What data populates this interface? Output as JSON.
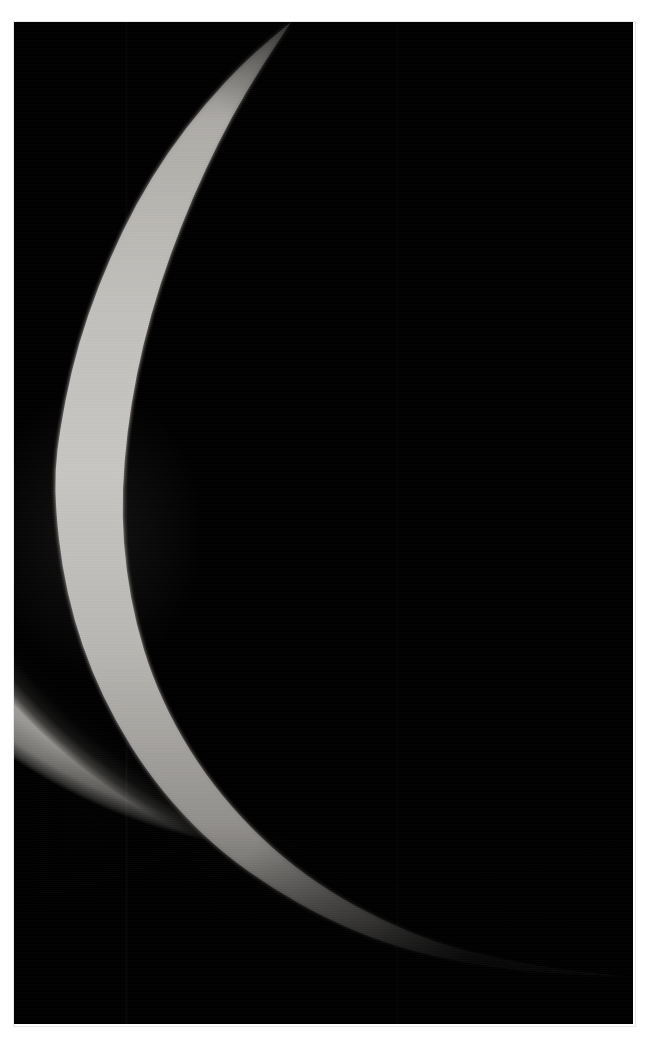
{
  "page": {
    "width": 646,
    "height": 1062,
    "background_color": "#ffffff",
    "caption": ""
  },
  "plate": {
    "name": "astronomical-photograph",
    "left": 14,
    "top": 22,
    "width": 619,
    "height": 1002,
    "sky_color": "#000000",
    "border_color": "#e9e9e9"
  },
  "subject": {
    "name": "crescent-planet",
    "description": "Thin sunlit crescent limb of a gas-giant planet against black space",
    "limb_color": "#b2b0ac",
    "shadow_color": "#000000",
    "phase": "thin crescent",
    "illuminated_side": "left",
    "feature_label": "limb-cloud-streak"
  },
  "chart_data": {
    "type": "scatter",
    "xlabel": "x (px)",
    "ylabel": "y (px)",
    "xlim": [
      0,
      646
    ],
    "ylim": [
      0,
      1062
    ],
    "grid": false,
    "legend": "none",
    "series": [
      {
        "name": "outer-limb",
        "x": [
          291,
          246,
          205,
          168,
          136,
          110,
          88,
          71,
          60,
          55,
          56,
          62,
          74,
          92,
          116,
          146,
          182,
          224,
          272,
          325,
          382,
          441,
          500,
          556,
          600,
          625
        ],
        "y": [
          22,
          60,
          104,
          152,
          204,
          258,
          314,
          372,
          430,
          470,
          512,
          566,
          620,
          672,
          722,
          770,
          814,
          854,
          888,
          918,
          942,
          958,
          968,
          973,
          975,
          976
        ]
      },
      {
        "name": "inner-terminator",
        "x": [
          291,
          262,
          232,
          205,
          181,
          160,
          143,
          131,
          124,
          122,
          126,
          136,
          152,
          175,
          205,
          241,
          283,
          330,
          381,
          436,
          492,
          547,
          596,
          625
        ],
        "y": [
          22,
          66,
          116,
          170,
          226,
          284,
          344,
          404,
          462,
          516,
          570,
          624,
          676,
          726,
          774,
          818,
          858,
          892,
          920,
          943,
          958,
          968,
          974,
          976
        ]
      }
    ]
  }
}
